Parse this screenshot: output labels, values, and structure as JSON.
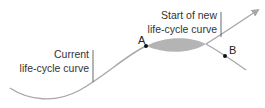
{
  "diagram": {
    "type": "life-cycle-curves",
    "colors": {
      "curve": "#a8a8a8",
      "lens_fill": "#b4b4b4",
      "tick": "#444444",
      "point": "#111111",
      "text": "#333333"
    },
    "labels": {
      "current_line1": "Current",
      "current_line2": "life-cycle curve",
      "new_line1": "Start of new",
      "new_line2": "life-cycle curve"
    },
    "points": [
      {
        "id": "A",
        "label": "A"
      },
      {
        "id": "B",
        "label": "B"
      }
    ]
  }
}
